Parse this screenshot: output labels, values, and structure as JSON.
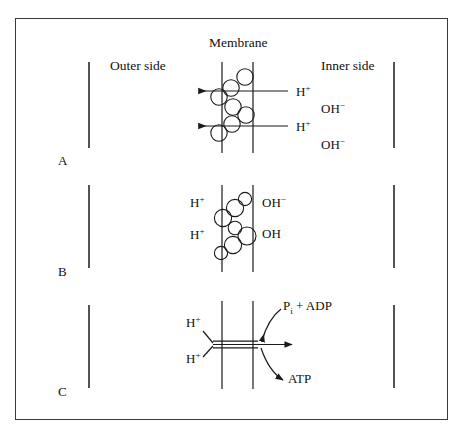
{
  "figure": {
    "border_color": "#3a3a3a",
    "background": "#ffffff",
    "line_color": "#1a1a1a"
  },
  "headers": {
    "membrane": "Membrane",
    "outer_side": "Outer side",
    "inner_side": "Inner side"
  },
  "panels": [
    {
      "letter": "A",
      "description": "Proton wire: chain of water molecules spanning the membrane; protons exit to the outer side while hydroxide remains on the inner side",
      "left_labels": [],
      "right_labels": [
        {
          "text": "H",
          "charge": "+"
        },
        {
          "text": "OH",
          "charge": "−"
        },
        {
          "text": "H",
          "charge": "+"
        },
        {
          "text": "OH",
          "charge": "−"
        }
      ],
      "arrows": 2,
      "arrow_direction": "leftward",
      "circles": 7
    },
    {
      "letter": "B",
      "description": "Water chain within the membrane; protons on the outer side, hydroxide and water on the inner side",
      "left_labels": [
        {
          "text": "H",
          "charge": "+"
        },
        {
          "text": "H",
          "charge": "+"
        }
      ],
      "right_labels": [
        {
          "text": "OH",
          "charge": "−"
        },
        {
          "text": "OH",
          "charge": ""
        }
      ],
      "arrows": 0,
      "circles": 7
    },
    {
      "letter": "C",
      "description": "ATP synthase channel: protons flow through the channel driving phosphorylation of ADP to ATP",
      "left_labels": [
        {
          "text": "H",
          "charge": "+"
        },
        {
          "text": "H",
          "charge": "+"
        }
      ],
      "right_labels": [
        {
          "text": "P",
          "subscript": "i",
          "suffix": " + ADP"
        },
        {
          "text": "ATP",
          "subscript": "",
          "suffix": ""
        }
      ],
      "arrows": 1,
      "arrow_direction": "rightward",
      "curved_arrows": 2
    }
  ],
  "chemistry": {
    "proton": "H",
    "proton_charge": "+",
    "hydroxide": "OH",
    "hydroxide_charge": "−",
    "water": "OH",
    "phosphate": "P",
    "phosphate_sub": "i",
    "adp_term": " + ADP",
    "atp": "ATP"
  }
}
